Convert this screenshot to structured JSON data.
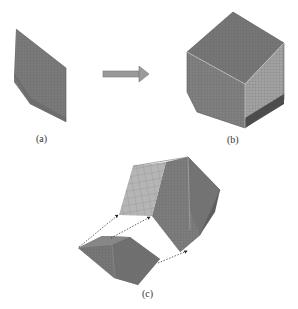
{
  "figure": {
    "panels": [
      {
        "id": "a",
        "label": "(a)",
        "description": "Thin meshed plate (single element slab)"
      },
      {
        "id": "b",
        "label": "(b)",
        "description": "Meshed polyhedral solid generated from plate"
      },
      {
        "id": "c",
        "label": "(c)",
        "description": "Exploded view showing plate mapped onto solid face"
      }
    ],
    "arrow": {
      "direction": "right",
      "meaning": "transforms to"
    },
    "colors": {
      "mesh_dark": "#6e6e6e",
      "mesh_mid": "#8a8a8a",
      "mesh_light": "#a9a9a9",
      "face_highlight": "#b5b5b5",
      "arrow_fill": "#9a9a9a",
      "mesh_line": "#5a5a5a"
    }
  }
}
